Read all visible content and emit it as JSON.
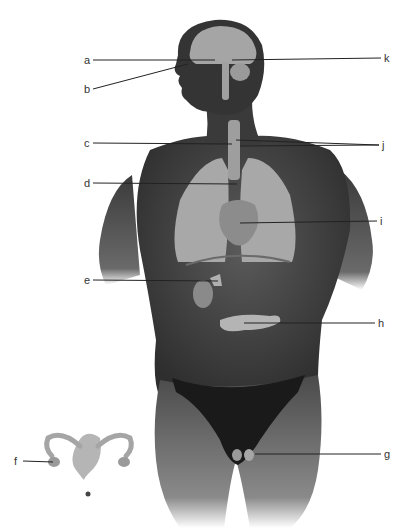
{
  "diagram": {
    "labels": [
      {
        "id": "a",
        "text": "a",
        "side": "left",
        "x": 84,
        "y": 60,
        "target": [
          215,
          60
        ]
      },
      {
        "id": "b",
        "text": "b",
        "side": "left",
        "x": 84,
        "y": 89,
        "target": [
          188,
          64
        ]
      },
      {
        "id": "c",
        "text": "c",
        "side": "left",
        "x": 84,
        "y": 143,
        "target": [
          232,
          144
        ]
      },
      {
        "id": "d",
        "text": "d",
        "side": "left",
        "x": 84,
        "y": 183,
        "target": [
          237,
          184
        ]
      },
      {
        "id": "e",
        "text": "e",
        "side": "left",
        "x": 84,
        "y": 280,
        "target": [
          218,
          281
        ]
      },
      {
        "id": "f",
        "text": "f",
        "side": "left",
        "x": 14,
        "y": 461,
        "target": [
          53,
          462
        ]
      },
      {
        "id": "g",
        "text": "g",
        "side": "right",
        "x": 384,
        "y": 454,
        "target": [
          255,
          454
        ]
      },
      {
        "id": "h",
        "text": "h",
        "side": "right",
        "x": 378,
        "y": 323,
        "target": [
          244,
          323
        ]
      },
      {
        "id": "i",
        "text": "i",
        "side": "right",
        "x": 380,
        "y": 221,
        "target": [
          240,
          223
        ]
      },
      {
        "id": "j",
        "text": "j",
        "side": "right",
        "x": 382,
        "y": 145,
        "target": [
          236,
          140
        ]
      },
      {
        "id": "k",
        "text": "k",
        "side": "right",
        "x": 384,
        "y": 58,
        "target": [
          232,
          60
        ]
      }
    ],
    "colors": {
      "skin": "#3a3a3a",
      "skin_light": "#5a5a5a",
      "organ": "#a9a9a9",
      "organ_dark": "#7d7d7d",
      "line": "#222222",
      "underwear": "#1a1a1a"
    }
  }
}
